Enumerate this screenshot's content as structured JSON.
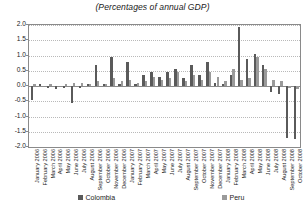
{
  "chart_data": {
    "type": "bar",
    "title": "(Percentages of annual GDP)",
    "xlabel": "",
    "ylabel": "",
    "ylim": [
      -2.0,
      2.0
    ],
    "ytick_labels": [
      "2.0",
      "1.5",
      "1.0",
      "0.5",
      "0.0",
      "-0.5",
      "-1.0",
      "-1.5",
      "-2.0"
    ],
    "ytick_values": [
      2.0,
      1.5,
      1.0,
      0.5,
      0.0,
      -0.5,
      -1.0,
      -1.5,
      -2.0
    ],
    "grid": true,
    "legend_position": "bottom",
    "categories": [
      "January 2006",
      "February 2006",
      "March 2006",
      "April 2006",
      "May 2006",
      "June 2006",
      "July 2006",
      "August 2006",
      "September 2006",
      "October 2006",
      "November 2006",
      "December 2006",
      "January 2007",
      "February 2007",
      "March 2007",
      "April 2007",
      "May 2007",
      "June 2007",
      "July 2007",
      "August 2007",
      "September 2007",
      "October 2007",
      "November 2007",
      "December 2007",
      "January 2008",
      "February 2008",
      "March 2008",
      "April 2008",
      "May 2008",
      "June 2008",
      "July 2008",
      "August 2008",
      "September 2008",
      "October 2008"
    ],
    "series": [
      {
        "name": "Colombia",
        "color": "#5a5a5a",
        "values": [
          -0.45,
          0.05,
          -0.05,
          -0.1,
          -0.05,
          -0.55,
          -0.05,
          0.05,
          0.7,
          0.05,
          0.95,
          0.05,
          0.8,
          0.05,
          0.35,
          0.45,
          0.3,
          0.45,
          0.55,
          0.25,
          0.7,
          0.35,
          0.8,
          0.1,
          0.05,
          0.35,
          1.95,
          0.9,
          1.05,
          0.7,
          -0.2,
          -0.25,
          -1.7,
          -1.75
        ]
      },
      {
        "name": "Peru",
        "color": "#9a9a9a",
        "values": [
          0.05,
          0.0,
          0.05,
          0.0,
          0.05,
          0.1,
          0.1,
          0.05,
          0.15,
          0.05,
          0.25,
          0.15,
          0.2,
          0.1,
          0.15,
          0.3,
          0.2,
          0.25,
          0.45,
          0.15,
          0.35,
          0.2,
          0.45,
          0.3,
          0.15,
          0.55,
          0.2,
          0.25,
          0.95,
          0.55,
          0.2,
          0.15,
          -0.05,
          -0.1
        ]
      }
    ]
  },
  "legend": {
    "items": [
      {
        "label": "Colombia",
        "color": "#5a5a5a"
      },
      {
        "label": "Peru",
        "color": "#9a9a9a"
      }
    ]
  }
}
